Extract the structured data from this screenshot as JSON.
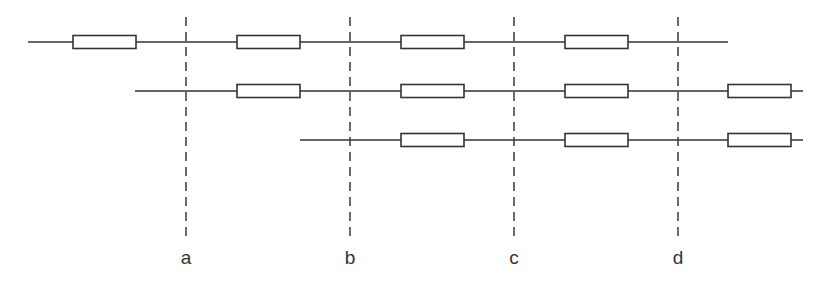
{
  "diagram": {
    "colors": {
      "stroke": "#333333",
      "dash": "#444444",
      "background": "#ffffff"
    },
    "rows": [
      {
        "y": 42,
        "x1": 28,
        "x2": 728,
        "boxes": [
          73,
          237,
          401,
          565
        ]
      },
      {
        "y": 91,
        "x1": 135,
        "x2": 803,
        "boxes": [
          237,
          401,
          565,
          728
        ]
      },
      {
        "y": 140,
        "x1": 300,
        "x2": 803,
        "boxes": [
          401,
          565,
          728
        ]
      }
    ],
    "box": {
      "width": 63,
      "height": 13
    },
    "dividers": [
      {
        "x": 186,
        "label": "a"
      },
      {
        "x": 350,
        "label": "b"
      },
      {
        "x": 514,
        "label": "c"
      },
      {
        "x": 678,
        "label": "d"
      }
    ],
    "divider_y1": 17,
    "divider_y2": 240,
    "label_y": 264
  }
}
